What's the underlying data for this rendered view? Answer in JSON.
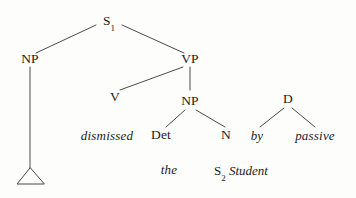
{
  "diagram": {
    "stroke_color": "#4a4a4a",
    "text_color": "#1b1b1b",
    "background": "#fdfdfb"
  },
  "nodes": {
    "s1": {
      "label": "S",
      "subscript": "1"
    },
    "np_subject": {
      "label": "NP"
    },
    "vp": {
      "label": "VP"
    },
    "v": {
      "label": "V"
    },
    "np_object": {
      "label": "NP"
    },
    "det": {
      "label": "Det"
    },
    "n": {
      "label": "N"
    },
    "d": {
      "label": "D"
    }
  },
  "terminals": {
    "dismissed": {
      "label": "dismissed"
    },
    "the": {
      "label": "the"
    },
    "s2_student": {
      "subscript_label": "S",
      "subscript": "2",
      "word": "Student"
    },
    "by": {
      "label": "by"
    },
    "passive": {
      "label": "passive"
    }
  }
}
